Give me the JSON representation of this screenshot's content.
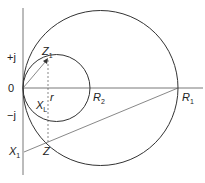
{
  "diagram": {
    "type": "impedance-circle-diagram",
    "colors": {
      "stroke": "#333333",
      "background": "#ffffff"
    },
    "axes": {
      "horizontal": {
        "from": [
          23,
          88
        ],
        "to": [
          203,
          88
        ]
      },
      "vertical": {
        "from": [
          23,
          8
        ],
        "to": [
          23,
          175
        ]
      }
    },
    "circles": [
      {
        "name": "large",
        "cx": 100.5,
        "cy": 88,
        "r": 77.5
      },
      {
        "name": "small",
        "cx": 56.5,
        "cy": 88,
        "r": 33.5
      }
    ],
    "labels": {
      "plus_j": "+j",
      "minus_j": "−j",
      "origin": "0",
      "z1": "Z",
      "z1_sub": "1",
      "r": "r",
      "xl": "X",
      "xl_sub": "L",
      "r2": "R",
      "r2_sub": "2",
      "r1": "R",
      "r1_sub": "1",
      "x1": "X",
      "x1_sub": "1",
      "z": "Z"
    }
  }
}
